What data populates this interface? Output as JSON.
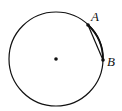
{
  "diagram": {
    "type": "geometry",
    "circle": {
      "cx": 56,
      "cy": 59,
      "r": 47,
      "stroke": "#111111"
    },
    "center_point": {
      "x": 56,
      "y": 59
    },
    "points": [
      {
        "label": "A",
        "x": 88,
        "y": 25,
        "label_x": 91,
        "label_y": 21
      },
      {
        "label": "B",
        "x": 103,
        "y": 60,
        "label_x": 107,
        "label_y": 66
      }
    ],
    "chord": {
      "from": "A",
      "to": "B"
    }
  }
}
